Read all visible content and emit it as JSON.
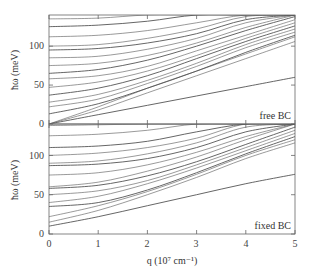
{
  "chart_data": [
    {
      "type": "line",
      "panel": "top",
      "annotation": "free BC",
      "xlabel": "",
      "ylabel": "ħω (meV)",
      "xlim": [
        0,
        5
      ],
      "ylim": [
        0,
        140
      ],
      "yticks": [
        0,
        50,
        100
      ],
      "xticks": [
        0,
        1,
        2,
        3,
        4,
        5
      ],
      "grid": false,
      "x": [
        0,
        1,
        2,
        3,
        4,
        5
      ],
      "series": [
        {
          "name": "branch-1",
          "values": [
            0,
            12,
            24,
            36,
            48,
            60
          ]
        },
        {
          "name": "branch-2",
          "values": [
            0,
            18,
            40,
            62,
            84,
            106
          ]
        },
        {
          "name": "branch-3",
          "values": [
            0,
            22,
            46,
            68,
            90,
            112
          ]
        },
        {
          "name": "branch-4",
          "values": [
            13,
            26,
            46,
            68,
            92,
            114
          ]
        },
        {
          "name": "branch-5",
          "values": [
            22,
            32,
            52,
            74,
            98,
            118
          ]
        },
        {
          "name": "branch-6",
          "values": [
            28,
            38,
            56,
            78,
            102,
            122
          ]
        },
        {
          "name": "branch-7",
          "values": [
            37,
            46,
            62,
            84,
            106,
            126
          ]
        },
        {
          "name": "branch-8",
          "values": [
            47,
            54,
            68,
            88,
            110,
            130
          ]
        },
        {
          "name": "branch-9",
          "values": [
            58,
            62,
            74,
            94,
            114,
            134
          ]
        },
        {
          "name": "branch-10",
          "values": [
            65,
            70,
            82,
            100,
            120,
            138
          ]
        },
        {
          "name": "branch-11",
          "values": [
            75,
            78,
            88,
            104,
            124,
            140
          ]
        },
        {
          "name": "branch-12",
          "values": [
            85,
            87,
            96,
            110,
            130,
            140
          ]
        },
        {
          "name": "branch-13",
          "values": [
            95,
            97,
            104,
            116,
            134,
            140
          ]
        },
        {
          "name": "branch-14",
          "values": [
            100,
            102,
            110,
            122,
            138,
            140
          ]
        },
        {
          "name": "branch-15",
          "values": [
            112,
            114,
            120,
            130,
            140,
            140
          ]
        },
        {
          "name": "branch-16",
          "values": [
            125,
            127,
            132,
            140,
            140,
            140
          ]
        },
        {
          "name": "branch-17",
          "values": [
            135,
            136,
            140,
            140,
            140,
            140
          ]
        }
      ]
    },
    {
      "type": "line",
      "panel": "bottom",
      "annotation": "fixed BC",
      "xlabel": "q (10⁷ cm⁻¹)",
      "ylabel": "ħω (meV)",
      "xlim": [
        0,
        5
      ],
      "ylim": [
        0,
        140
      ],
      "yticks": [
        0,
        50,
        100
      ],
      "xticks": [
        0,
        1,
        2,
        3,
        4,
        5
      ],
      "grid": false,
      "x": [
        0,
        1,
        2,
        3,
        4,
        5
      ],
      "series": [
        {
          "name": "branch-1",
          "values": [
            10,
            22,
            36,
            50,
            64,
            76
          ]
        },
        {
          "name": "branch-2",
          "values": [
            15,
            30,
            50,
            72,
            96,
            116
          ]
        },
        {
          "name": "branch-3",
          "values": [
            22,
            36,
            54,
            76,
            100,
            120
          ]
        },
        {
          "name": "branch-4",
          "values": [
            35,
            40,
            56,
            78,
            102,
            124
          ]
        },
        {
          "name": "branch-5",
          "values": [
            40,
            48,
            64,
            84,
            106,
            128
          ]
        },
        {
          "name": "branch-6",
          "values": [
            50,
            55,
            68,
            88,
            110,
            132
          ]
        },
        {
          "name": "branch-7",
          "values": [
            58,
            62,
            74,
            92,
            114,
            136
          ]
        },
        {
          "name": "branch-8",
          "values": [
            60,
            66,
            80,
            98,
            120,
            140
          ]
        },
        {
          "name": "branch-9",
          "values": [
            75,
            78,
            88,
            104,
            124,
            140
          ]
        },
        {
          "name": "branch-10",
          "values": [
            87,
            89,
            96,
            110,
            130,
            140
          ]
        },
        {
          "name": "branch-11",
          "values": [
            90,
            93,
            102,
            116,
            136,
            140
          ]
        },
        {
          "name": "branch-12",
          "values": [
            100,
            103,
            110,
            122,
            140,
            140
          ]
        },
        {
          "name": "branch-13",
          "values": [
            110,
            112,
            118,
            130,
            140,
            140
          ]
        },
        {
          "name": "branch-14",
          "values": [
            125,
            127,
            132,
            140,
            140,
            140
          ]
        },
        {
          "name": "branch-15",
          "values": [
            138,
            139,
            140,
            140,
            140,
            140
          ]
        }
      ]
    }
  ],
  "labels": {
    "top_ylabel": "ħω (meV)",
    "bottom_ylabel": "ħω (meV)",
    "xlabel": "q (10⁷ cm⁻¹)",
    "top_annotation": "free BC",
    "bottom_annotation": "fixed BC",
    "ytick_0": "0",
    "ytick_50": "50",
    "ytick_100": "100",
    "xticks": [
      "0",
      "1",
      "2",
      "3",
      "4",
      "5"
    ]
  },
  "colors": {
    "axis": "#666666",
    "curve": "#555555",
    "text": "#333333"
  }
}
